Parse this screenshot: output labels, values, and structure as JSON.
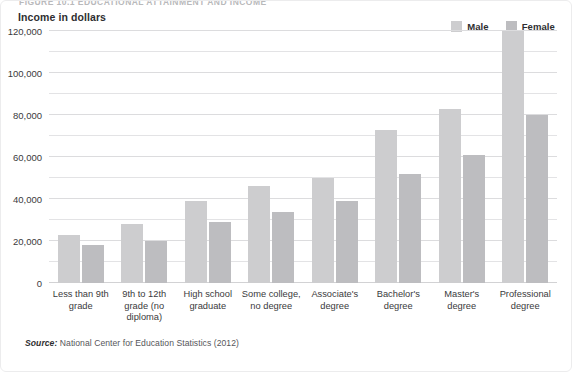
{
  "figure": {
    "running_head": "FIGURE 10.1    EDUCATIONAL ATTAINMENT AND INCOME",
    "axis_title": "Income in dollars",
    "source_prefix": "Source:",
    "source_text": " National Center for Education Statistics (2012)"
  },
  "legend": {
    "position": "top-right",
    "items": [
      {
        "label": "Male",
        "color": "#cdcdcf"
      },
      {
        "label": "Female",
        "color": "#bdbdc0"
      }
    ]
  },
  "chart_data": {
    "type": "bar",
    "title": "Income in dollars",
    "xlabel": "",
    "ylabel": "Income in dollars",
    "ylim": [
      0,
      120000
    ],
    "ytick_labels": [
      "0",
      "20,000",
      "40,000",
      "60,000",
      "80,000",
      "100,000",
      "120,000"
    ],
    "ytick_values": [
      0,
      20000,
      40000,
      60000,
      80000,
      100000,
      120000
    ],
    "minor_tick_interval": 10000,
    "grid": true,
    "categories": [
      "Less than 9th grade",
      "9th to 12th grade (no diploma)",
      "High school graduate",
      "Some college, no degree",
      "Associate's degree",
      "Bachelor's degree",
      "Master's degree",
      "Professional degree"
    ],
    "series": [
      {
        "name": "Male",
        "color": "#cdcdcf",
        "values": [
          23000,
          28000,
          39000,
          46000,
          50000,
          73000,
          83000,
          120000
        ]
      },
      {
        "name": "Female",
        "color": "#bdbdc0",
        "values": [
          18000,
          20000,
          29000,
          34000,
          39000,
          52000,
          61000,
          80000
        ]
      }
    ]
  }
}
